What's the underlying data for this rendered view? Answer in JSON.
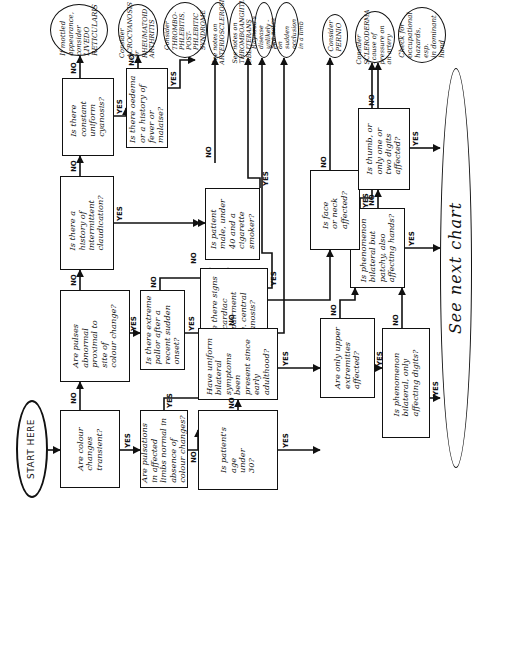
{
  "start": {
    "label": "START HERE"
  },
  "questions": {
    "q1": "Are colour\nchanges\ntransient?",
    "q2": "Are pulses\nabnormal\nproximal to\nsite of\ncolour change?",
    "q3": "Is there a\nhistory of\nintermittent\nclaudication?",
    "q4": "Is there\nconstant\nuniform\ncyanosis?",
    "q5": "Is there oedema\nor a history of\nfever or malaise?",
    "q6": "Is patient\nmale, under\n40 and a\ncigarette\nsmoker?",
    "q7": "Are there signs\nof cardiac\nimpairment\ne.g. central\ncyanosis?",
    "q8": "Is there extreme\npallor after a\nrecent sudden\nonset?",
    "q9": "Are pulsations\nin affected\nlimbs normal in\nabsence of\ncolour changes?",
    "q10": "Is patient's\nage\nunder\n30?",
    "q11": "Have uniform\nbilateral\nsymptoms been\npresent since\nearly\nadulthood?",
    "q12": "Are only upper\nextremities\naffected?",
    "q13": "Is phenomenon\nbilateral, only\naffecting digits?",
    "q14": "Is phenomenon\nbilateral but\npatchy, also\naffecting hands?",
    "q15": "Is face\nor neck\naffected?",
    "q16": "Is thumb, or\nonly one or\ntwo digits\naffected?"
  },
  "outcomes": {
    "o1": "If mottled\nappearance,\nconsider\nLIVEDO\nRETICULARIS",
    "o2": "Consider\nACROCYANOSIS\nor\nRHEUMATOID\nARTHRITIS",
    "o3": "Consider\nTHROMBO-\nPHLEBITIS,\nPOST-PHLEBITIC\nSYNDROME",
    "o4": "See notes on\nARTERIOSCLEROSIS",
    "o5": "See notes on\nTHROMBOANGIITIS\nOBLITERANS",
    "o6": "Raynaud's disease\nunlikely - check",
    "o7": "See notes on\nsudden occlusion\nin a limb",
    "o8": "Consider\nPERNIO",
    "o9": "Consider\nSCLERODERMA\n- cause of\npressure on\nan artery",
    "o10": "Check for\noccupational\nhazards, esp.\nin dominant\nhand",
    "next": "See next chart"
  },
  "labels": {
    "yes": "YES",
    "no": "NO"
  }
}
